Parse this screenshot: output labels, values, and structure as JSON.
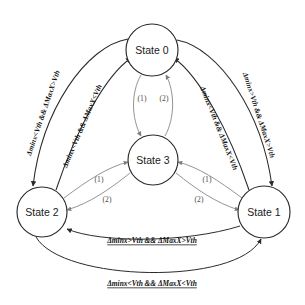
{
  "diagram": {
    "background_color": "#ffffff",
    "node_stroke_color": "#2b2b2b",
    "outer_edge_color": "#2b2b2b",
    "inner_edge_color": "#8d8d8d"
  },
  "nodes": [
    {
      "id": "state0",
      "label": "State 0",
      "cx": 152,
      "cy": 50,
      "r": 26
    },
    {
      "id": "state3",
      "label": "State 3",
      "cx": 153,
      "cy": 160,
      "r": 25
    },
    {
      "id": "state2",
      "label": "State 2",
      "cx": 42,
      "cy": 212,
      "r": 25
    },
    {
      "id": "state1",
      "label": "State 1",
      "cx": 264,
      "cy": 212,
      "r": 26
    }
  ],
  "edges": {
    "state0_to_state2": {
      "label": "Δminx<Vth && ΔMaxX>Vth"
    },
    "state2_to_state0": {
      "label": "Δminx<Vth && ΔMaxX<Vth"
    },
    "state1_to_state0": {
      "label": "Δminx<Vth && ΔMaxX<Vth"
    },
    "state0_to_state1": {
      "label": "Δminx>Vth && ΔMaxX>Vth"
    },
    "state1_to_state2": {
      "label": "Δminx>Vth && ΔMaxX>Vth"
    },
    "state2_to_state1": {
      "label": "Δminx<Vth && ΔMaxX<Vth"
    },
    "state0_to_state3": {
      "label": "(1)"
    },
    "state3_to_state0": {
      "label": "(2)"
    },
    "state2_to_state3": {
      "label": "(1)"
    },
    "state3_to_state2": {
      "label": "(2)"
    },
    "state1_to_state3": {
      "label": "(1)"
    },
    "state3_to_state1": {
      "label": "(2)"
    }
  }
}
